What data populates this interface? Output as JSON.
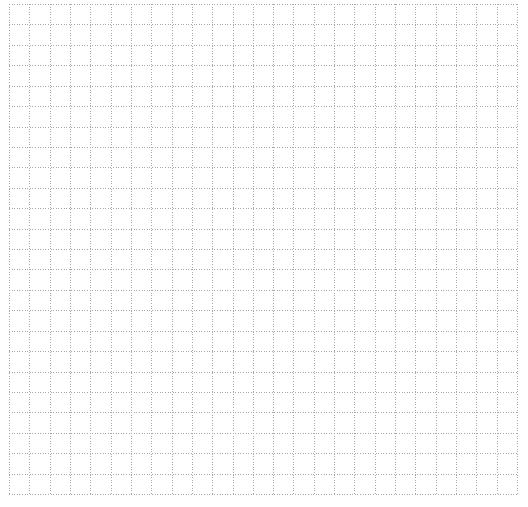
{
  "canvas": {
    "width": 528,
    "height": 507,
    "background": "#ffffff"
  },
  "grid": {
    "left": 9,
    "top": 4,
    "right": 517,
    "bottom": 494,
    "columns": 25,
    "rows": 24,
    "line_color": "#a8a8a8",
    "line_width": 1,
    "dash_pattern": "1 1.6"
  }
}
